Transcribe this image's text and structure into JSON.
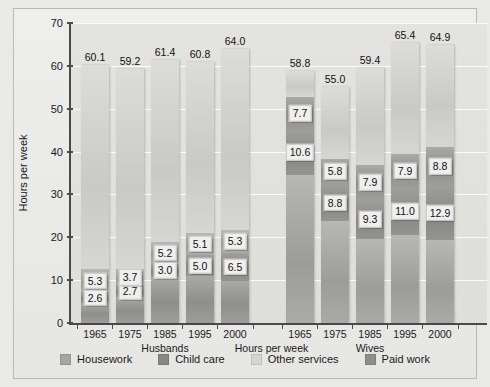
{
  "chart_data": {
    "type": "bar",
    "subtype": "stacked-bar-grouped",
    "title": "",
    "xlabel": "Hours per week",
    "ylabel": "Hours per week",
    "ylim": [
      0,
      70
    ],
    "yticks": [
      0,
      10,
      20,
      30,
      40,
      50,
      60,
      70
    ],
    "ytick_labels": [
      "0",
      "10",
      "20",
      "30",
      "40",
      "50",
      "60",
      "70"
    ],
    "grid": true,
    "legend_position": "bottom",
    "legend": [
      "Housework",
      "Child care",
      "Other services",
      "Paid work"
    ],
    "series": [
      {
        "name": "Paid work",
        "color": "#8e8e8b"
      },
      {
        "name": "Other services",
        "color": "#d2d2cf"
      },
      {
        "name": "Child care",
        "color": "#86868 3"
      },
      {
        "name": "Housework",
        "color": "#a5a5a2"
      }
    ],
    "groups": [
      {
        "name": "Husbands",
        "categories": [
          "1965",
          "1975",
          "1985",
          "1995",
          "2000"
        ],
        "totals": [
          60.1,
          59.2,
          61.4,
          60.8,
          64.0
        ],
        "bars": [
          {
            "category": "1965",
            "total": 60.1,
            "segments": [
              {
                "name": "Paid work",
                "value": 4.6,
                "label": ""
              },
              {
                "name": "Child care",
                "value": 2.6,
                "label": "2.6"
              },
              {
                "name": "Housework",
                "value": 5.3,
                "label": "5.3"
              },
              {
                "name": "Other services",
                "value": 47.6,
                "label": ""
              }
            ]
          },
          {
            "category": "1975",
            "total": 59.2,
            "segments": [
              {
                "name": "Paid work",
                "value": 6.1,
                "label": ""
              },
              {
                "name": "Child care",
                "value": 2.7,
                "label": "2.7"
              },
              {
                "name": "Housework",
                "value": 3.7,
                "label": "3.7"
              },
              {
                "name": "Other services",
                "value": 46.7,
                "label": ""
              }
            ]
          },
          {
            "category": "1985",
            "total": 61.4,
            "segments": [
              {
                "name": "Paid work",
                "value": 10.8,
                "label": ""
              },
              {
                "name": "Child care",
                "value": 3.0,
                "label": "3.0"
              },
              {
                "name": "Housework",
                "value": 5.2,
                "label": "5.2"
              },
              {
                "name": "Other services",
                "value": 42.4,
                "label": ""
              }
            ]
          },
          {
            "category": "1995",
            "total": 60.8,
            "segments": [
              {
                "name": "Paid work",
                "value": 10.9,
                "label": ""
              },
              {
                "name": "Child care",
                "value": 5.0,
                "label": "5.0"
              },
              {
                "name": "Housework",
                "value": 5.1,
                "label": "5.1"
              },
              {
                "name": "Other services",
                "value": 39.8,
                "label": ""
              }
            ]
          },
          {
            "category": "2000",
            "total": 64.0,
            "segments": [
              {
                "name": "Paid work",
                "value": 9.9,
                "label": ""
              },
              {
                "name": "Child care",
                "value": 6.5,
                "label": "6.5"
              },
              {
                "name": "Housework",
                "value": 5.3,
                "label": "5.3"
              },
              {
                "name": "Other services",
                "value": 42.3,
                "label": ""
              }
            ]
          }
        ]
      },
      {
        "name": "Wives",
        "categories": [
          "1965",
          "1975",
          "1985",
          "1995",
          "2000"
        ],
        "totals": [
          58.8,
          55.0,
          59.4,
          65.4,
          64.9
        ],
        "bars": [
          {
            "category": "1965",
            "total": 58.8,
            "segments": [
              {
                "name": "Housework",
                "value": 34.5,
                "label": ""
              },
              {
                "name": "Child care",
                "value": 10.6,
                "label": "10.6"
              },
              {
                "name": "Paid work",
                "value": 7.7,
                "label": "7.7"
              },
              {
                "name": "Other services",
                "value": 6.0,
                "label": ""
              }
            ]
          },
          {
            "category": "1975",
            "total": 55.0,
            "segments": [
              {
                "name": "Housework",
                "value": 23.7,
                "label": ""
              },
              {
                "name": "Child care",
                "value": 8.8,
                "label": "8.8"
              },
              {
                "name": "Paid work",
                "value": 5.8,
                "label": "5.8"
              },
              {
                "name": "Other services",
                "value": 16.7,
                "label": ""
              }
            ]
          },
          {
            "category": "1985",
            "total": 59.4,
            "segments": [
              {
                "name": "Housework",
                "value": 19.6,
                "label": ""
              },
              {
                "name": "Child care",
                "value": 9.3,
                "label": "9.3"
              },
              {
                "name": "Paid work",
                "value": 7.9,
                "label": "7.9"
              },
              {
                "name": "Other services",
                "value": 22.6,
                "label": ""
              }
            ]
          },
          {
            "category": "1995",
            "total": 65.4,
            "segments": [
              {
                "name": "Housework",
                "value": 20.6,
                "label": ""
              },
              {
                "name": "Child care",
                "value": 11.0,
                "label": "11.0"
              },
              {
                "name": "Paid work",
                "value": 7.9,
                "label": "7.9"
              },
              {
                "name": "Other services",
                "value": 25.9,
                "label": ""
              }
            ]
          },
          {
            "category": "2000",
            "total": 64.9,
            "segments": [
              {
                "name": "Housework",
                "value": 19.3,
                "label": ""
              },
              {
                "name": "Child care",
                "value": 12.9,
                "label": "12.9"
              },
              {
                "name": "Paid work",
                "value": 8.8,
                "label": "8.8"
              },
              {
                "name": "Other services",
                "value": 23.9,
                "label": ""
              }
            ]
          }
        ]
      }
    ]
  },
  "axis": {
    "y_title": "Hours per week",
    "x_title": "Hours per week"
  },
  "legend_items": [
    {
      "label": "Housework",
      "color": "#a5a5a2",
      "icon": "legend-swatch-icon"
    },
    {
      "label": "Child care",
      "color": "#878784",
      "icon": "legend-swatch-icon"
    },
    {
      "label": "Other services",
      "color": "#d4d4d1",
      "icon": "legend-swatch-icon"
    },
    {
      "label": "Paid work",
      "color": "#8e8e8b",
      "icon": "legend-swatch-icon"
    }
  ]
}
